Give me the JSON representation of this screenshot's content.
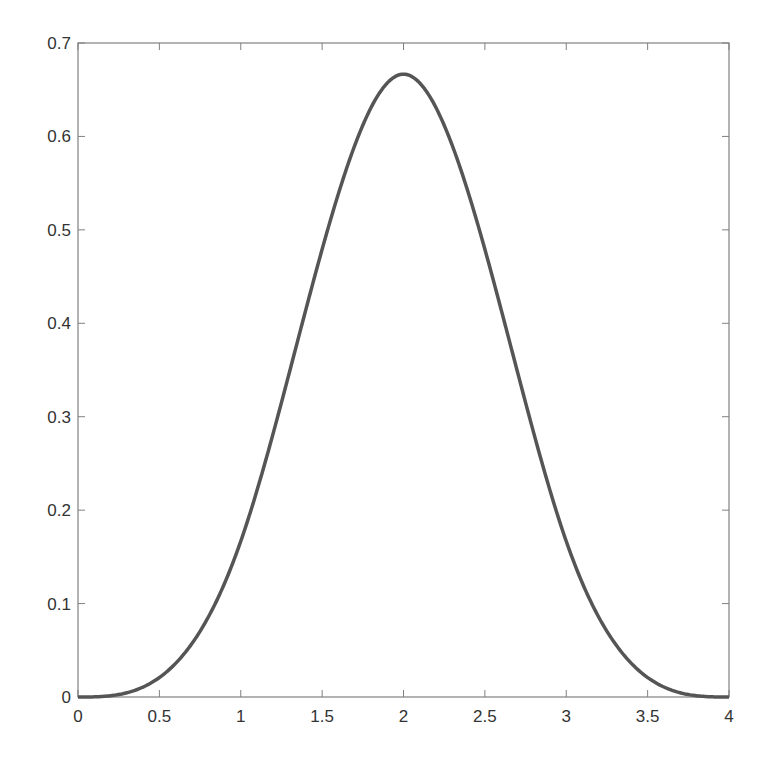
{
  "chart_data": {
    "type": "line",
    "title": "",
    "xlabel": "",
    "ylabel": "",
    "xlim": [
      0,
      4
    ],
    "ylim": [
      0,
      0.7
    ],
    "grid": false,
    "legend": null,
    "x_ticks": [
      "0",
      "0.5",
      "1",
      "1.5",
      "2",
      "2.5",
      "3",
      "3.5",
      "4"
    ],
    "y_ticks": [
      "0",
      "0.1",
      "0.2",
      "0.3",
      "0.4",
      "0.5",
      "0.6",
      "0.7"
    ],
    "series": [
      {
        "name": "cubic B-spline basis",
        "color": "#555555",
        "x": [
          0,
          0.25,
          0.5,
          0.75,
          1,
          1.25,
          1.5,
          1.75,
          2,
          2.25,
          2.5,
          2.75,
          3,
          3.25,
          3.5,
          3.75,
          4
        ],
        "y": [
          0,
          0.0026,
          0.0208,
          0.0703,
          0.1667,
          0.3151,
          0.4792,
          0.612,
          0.6667,
          0.612,
          0.4792,
          0.3151,
          0.1667,
          0.0703,
          0.0208,
          0.0026,
          0
        ]
      }
    ]
  },
  "colors": {
    "axis": "#808080",
    "line": "#555555",
    "text": "#333333"
  }
}
